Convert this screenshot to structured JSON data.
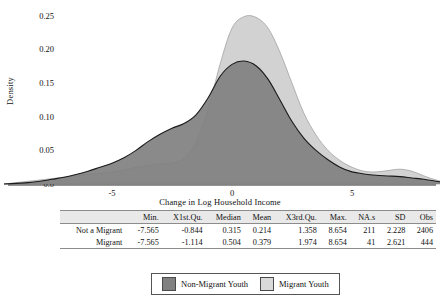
{
  "chart_data": {
    "type": "area",
    "title": "",
    "xlabel": "Change in Log Household Income",
    "ylabel": "Density",
    "xlim": [
      -9.5,
      9.2
    ],
    "ylim": [
      0.0,
      0.26
    ],
    "grid": false,
    "xticks": [
      -5,
      0,
      5
    ],
    "xtick_labels": [
      "-5",
      "0",
      "5"
    ],
    "yticks": [
      0.0,
      0.05,
      0.1,
      0.15,
      0.2,
      0.25
    ],
    "ytick_labels": [
      "0.0",
      "0.05",
      "0.10",
      "0.15",
      "0.20",
      "0.25"
    ],
    "legend_position": "bottom",
    "series": [
      {
        "name": "Non-Migrant Youth",
        "color": "#808080",
        "stroke": "#1a1a1a",
        "peak_value": 0.183,
        "peak_x": 0.4,
        "x": [
          -9.5,
          -9.0,
          -8.5,
          -8.0,
          -7.5,
          -7.0,
          -6.5,
          -6.0,
          -5.5,
          -5.0,
          -4.5,
          -4.0,
          -3.5,
          -3.0,
          -2.5,
          -2.0,
          -1.5,
          -1.0,
          -0.5,
          0.0,
          0.5,
          1.0,
          1.5,
          2.0,
          2.5,
          3.0,
          3.5,
          4.0,
          4.5,
          5.0,
          5.5,
          6.0,
          6.5,
          7.0,
          7.5,
          8.0,
          8.5,
          9.0,
          9.2
        ],
        "y": [
          0.0,
          0.001,
          0.002,
          0.004,
          0.007,
          0.01,
          0.014,
          0.019,
          0.025,
          0.031,
          0.039,
          0.05,
          0.063,
          0.074,
          0.083,
          0.09,
          0.103,
          0.128,
          0.16,
          0.178,
          0.183,
          0.176,
          0.156,
          0.125,
          0.093,
          0.068,
          0.05,
          0.036,
          0.025,
          0.018,
          0.015,
          0.013,
          0.012,
          0.011,
          0.009,
          0.007,
          0.004,
          0.002,
          0.0
        ]
      },
      {
        "name": "Migrant Youth",
        "color": "#d2d2d2",
        "stroke": "#9a9a9a",
        "peak_value": 0.25,
        "peak_x": 0.0,
        "x": [
          -9.5,
          -9.0,
          -8.5,
          -8.0,
          -7.5,
          -7.0,
          -6.5,
          -6.0,
          -5.5,
          -5.0,
          -4.5,
          -4.0,
          -3.5,
          -3.0,
          -2.5,
          -2.0,
          -1.5,
          -1.0,
          -0.5,
          0.0,
          0.5,
          1.0,
          1.5,
          2.0,
          2.5,
          3.0,
          3.5,
          4.0,
          4.5,
          5.0,
          5.5,
          6.0,
          6.5,
          7.0,
          7.5,
          8.0,
          8.5,
          9.0,
          9.2
        ],
        "y": [
          0.0,
          0.002,
          0.004,
          0.006,
          0.008,
          0.01,
          0.012,
          0.014,
          0.016,
          0.018,
          0.021,
          0.025,
          0.028,
          0.03,
          0.031,
          0.038,
          0.062,
          0.11,
          0.178,
          0.232,
          0.249,
          0.248,
          0.232,
          0.196,
          0.15,
          0.105,
          0.073,
          0.05,
          0.035,
          0.025,
          0.019,
          0.018,
          0.02,
          0.022,
          0.019,
          0.012,
          0.006,
          0.002,
          0.0
        ]
      }
    ]
  },
  "table": {
    "columns": [
      "",
      "Min.",
      "X1st.Qu.",
      "Median",
      "Mean",
      "X3rd.Qu.",
      "Max.",
      "NA.s",
      "SD",
      "Obs"
    ],
    "rows": [
      {
        "label": "Not a Migrant",
        "values": [
          "-7.565",
          "-0.844",
          "0.315",
          "0.214",
          "1.358",
          "8.654",
          "211",
          "2.228",
          "2406"
        ]
      },
      {
        "label": "Migrant",
        "values": [
          "-7.565",
          "-1.114",
          "0.504",
          "0.379",
          "1.974",
          "8.654",
          "41",
          "2.621",
          "444"
        ]
      }
    ]
  },
  "legend": {
    "items": [
      {
        "label": "Non-Migrant Youth",
        "color": "#808080"
      },
      {
        "label": "Migrant Youth",
        "color": "#d9d9d9"
      }
    ]
  }
}
